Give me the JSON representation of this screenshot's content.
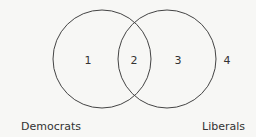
{
  "diagram": {
    "type": "venn",
    "stroke_color": "#444444",
    "sets": [
      {
        "name": "Democrats",
        "label": "Democrats"
      },
      {
        "name": "Liberals",
        "label": "Liberals"
      }
    ],
    "regions": [
      {
        "id": "1",
        "label": "1",
        "description": "Democrats only"
      },
      {
        "id": "2",
        "label": "2",
        "description": "Democrats and Liberals"
      },
      {
        "id": "3",
        "label": "3",
        "description": "Liberals only"
      },
      {
        "id": "4",
        "label": "4",
        "description": "Neither"
      }
    ]
  }
}
